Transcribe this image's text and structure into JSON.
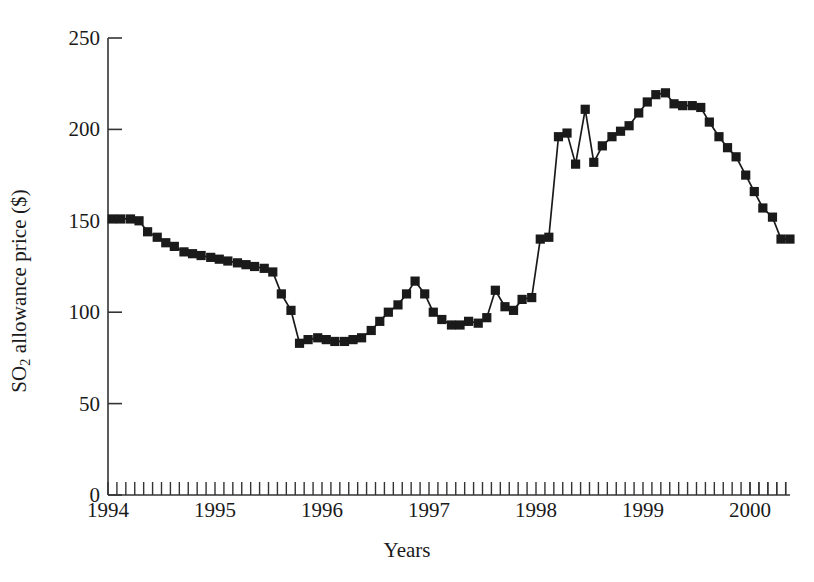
{
  "chart_data": {
    "type": "line",
    "title": "",
    "xlabel": "Years",
    "ylabel": "SO2 allowance price ($)",
    "ylabel_parts": {
      "prefix": "SO",
      "sub": "2",
      "suffix": " allowance price ($)"
    },
    "xlim": [
      1994.0,
      2000.35
    ],
    "ylim": [
      0,
      250
    ],
    "yticks": [
      0,
      50,
      100,
      150,
      200,
      250
    ],
    "xticks": [
      1994,
      1995,
      1996,
      1997,
      1998,
      1999,
      2000
    ],
    "xtick_labels": [
      "1994",
      "1995",
      "1996",
      "1997",
      "1998",
      "1999",
      "2000"
    ],
    "minor_x_ticks_per_year": 12,
    "grid": false,
    "legend": null,
    "marker": "square",
    "marker_color": "#1a1a1a",
    "line_color": "#1a1a1a",
    "series": [
      {
        "name": "SO2 allowance price",
        "x": [
          1994.04,
          1994.12,
          1994.21,
          1994.29,
          1994.37,
          1994.46,
          1994.54,
          1994.62,
          1994.71,
          1994.79,
          1994.87,
          1994.96,
          1995.04,
          1995.12,
          1995.21,
          1995.29,
          1995.37,
          1995.46,
          1995.54,
          1995.62,
          1995.71,
          1995.79,
          1995.87,
          1995.96,
          1996.04,
          1996.12,
          1996.21,
          1996.29,
          1996.37,
          1996.46,
          1996.54,
          1996.62,
          1996.71,
          1996.79,
          1996.87,
          1996.96,
          1997.04,
          1997.12,
          1997.21,
          1997.29,
          1997.37,
          1997.46,
          1997.54,
          1997.62,
          1997.71,
          1997.79,
          1997.87,
          1997.96,
          1998.04,
          1998.12,
          1998.21,
          1998.29,
          1998.37,
          1998.46,
          1998.54,
          1998.62,
          1998.71,
          1998.79,
          1998.87,
          1998.96,
          1999.04,
          1999.12,
          1999.21,
          1999.29,
          1999.37,
          1999.46,
          1999.54,
          1999.62,
          1999.71,
          1999.79,
          1999.87,
          1999.96,
          2000.04,
          2000.12,
          2000.21,
          2000.29
        ],
        "y": [
          151,
          151,
          151,
          150,
          144,
          141,
          138,
          136,
          133,
          132,
          131,
          130,
          129,
          128,
          127,
          126,
          125,
          124,
          122,
          110,
          101,
          83,
          85,
          86,
          85,
          84,
          84,
          85,
          86,
          90,
          95,
          100,
          104,
          110,
          117,
          110,
          100,
          96,
          93,
          93,
          95,
          94,
          97,
          112,
          103,
          101,
          107,
          108,
          140,
          141,
          196,
          198,
          181,
          211,
          182,
          191,
          196,
          199,
          202,
          209,
          215,
          219,
          220,
          214,
          213,
          213,
          212,
          204,
          196,
          190,
          185,
          175,
          166,
          157,
          152,
          140
        ],
        "y_tail": [
          140,
          140,
          140,
          140,
          140,
          140,
          146,
          150,
          151,
          155,
          157,
          157
        ]
      }
    ],
    "data_note": "Monthly SO2 allowance spot prices, 1994 through early 2000"
  },
  "axis": {
    "y_tick_labels": [
      "250",
      "200",
      "150",
      "100",
      "50",
      "0"
    ],
    "x_tick_labels": [
      "1994",
      "1995",
      "1996",
      "1997",
      "1998",
      "1999",
      "2000"
    ],
    "x_axis_title": "Years"
  }
}
